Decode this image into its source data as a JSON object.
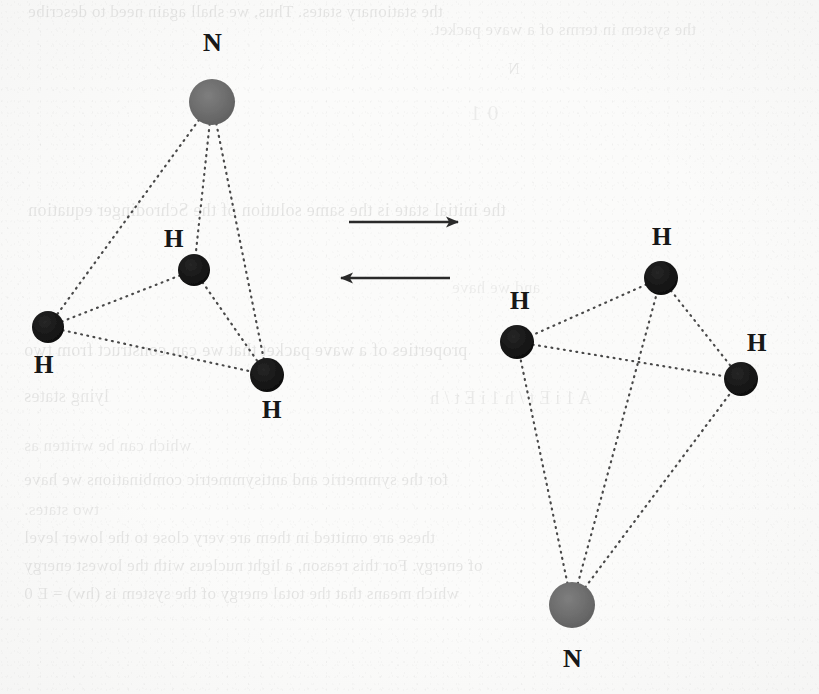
{
  "figure": {
    "kind": "molecular-diagram",
    "background_color": "#fbfbfa",
    "nitrogen_color": "#6b6b6b",
    "hydrogen_color": "#151515",
    "bond_color": "#4a4a4a",
    "arrow_color": "#2a2a2a"
  },
  "labels": {
    "nitrogen": "N",
    "hydrogen": "H"
  },
  "left_molecule": {
    "name": "ammonia-pyramid-apex-up",
    "atoms": [
      {
        "id": "N1",
        "element": "N",
        "label": "N",
        "cx": 212,
        "cy": 102,
        "r": 23,
        "kind": "nitrogen",
        "label_x": 203,
        "label_y": 30
      },
      {
        "id": "H1",
        "element": "H",
        "label": "H",
        "cx": 194,
        "cy": 270,
        "r": 16,
        "kind": "hydrogen",
        "label_x": 164,
        "label_y": 226
      },
      {
        "id": "H2",
        "element": "H",
        "label": "H",
        "cx": 48,
        "cy": 327,
        "r": 16,
        "kind": "hydrogen",
        "label_x": 34,
        "label_y": 352
      },
      {
        "id": "H3",
        "element": "H",
        "label": "H",
        "cx": 267,
        "cy": 375,
        "r": 17,
        "kind": "hydrogen",
        "label_x": 262,
        "label_y": 397
      }
    ],
    "bonds": [
      {
        "from": "N1",
        "to": "H1"
      },
      {
        "from": "N1",
        "to": "H2"
      },
      {
        "from": "N1",
        "to": "H3"
      },
      {
        "from": "H1",
        "to": "H2"
      },
      {
        "from": "H1",
        "to": "H3"
      },
      {
        "from": "H2",
        "to": "H3"
      }
    ]
  },
  "right_molecule": {
    "name": "ammonia-pyramid-apex-down",
    "atoms": [
      {
        "id": "N2",
        "element": "N",
        "label": "N",
        "cx": 572,
        "cy": 605,
        "r": 23,
        "kind": "nitrogen",
        "label_x": 563,
        "label_y": 646
      },
      {
        "id": "H4",
        "element": "H",
        "label": "H",
        "cx": 661,
        "cy": 278,
        "r": 17,
        "kind": "hydrogen",
        "label_x": 652,
        "label_y": 224
      },
      {
        "id": "H5",
        "element": "H",
        "label": "H",
        "cx": 517,
        "cy": 342,
        "r": 17,
        "kind": "hydrogen",
        "label_x": 510,
        "label_y": 288
      },
      {
        "id": "H6",
        "element": "H",
        "label": "H",
        "cx": 741,
        "cy": 379,
        "r": 17,
        "kind": "hydrogen",
        "label_x": 747,
        "label_y": 330
      }
    ],
    "bonds": [
      {
        "from": "N2",
        "to": "H4"
      },
      {
        "from": "N2",
        "to": "H5"
      },
      {
        "from": "N2",
        "to": "H6"
      },
      {
        "from": "H4",
        "to": "H5"
      },
      {
        "from": "H4",
        "to": "H6"
      },
      {
        "from": "H5",
        "to": "H6"
      }
    ]
  },
  "arrows": [
    {
      "name": "forward-arrow",
      "direction": "right",
      "x1": 349,
      "y1": 222,
      "x2": 458,
      "y2": 222
    },
    {
      "name": "reverse-arrow",
      "direction": "left",
      "x1": 450,
      "y1": 278,
      "x2": 341,
      "y2": 278
    }
  ],
  "ghost_text": {
    "note": "faint show-through text from the reverse side of the scanned page",
    "lines": [
      {
        "text": "the stationary states. Thus, we shall again need to describe",
        "x": 28,
        "y": 2,
        "size": 17,
        "opacity": 0.085
      },
      {
        "text": "the system in terms of a wave packet.",
        "x": 430,
        "y": 20,
        "size": 17,
        "opacity": 0.075
      },
      {
        "text": "N",
        "x": 508,
        "y": 60,
        "size": 16,
        "opacity": 0.08
      },
      {
        "text": "0   1",
        "x": 470,
        "y": 100,
        "size": 22,
        "opacity": 0.06
      },
      {
        "text": "the initial state is the same solution of the Schrodinger equation",
        "x": 28,
        "y": 200,
        "size": 18,
        "opacity": 0.085
      },
      {
        "text": "and we have",
        "x": 452,
        "y": 278,
        "size": 17,
        "opacity": 0.06
      },
      {
        "text": "properties of a wave packet that we can construct from two",
        "x": 24,
        "y": 340,
        "size": 18,
        "opacity": 0.085
      },
      {
        "text": "lying states",
        "x": 24,
        "y": 386,
        "size": 18,
        "opacity": 0.08
      },
      {
        "text": "A  1     i   E t / h     1     i   E t / h",
        "x": 430,
        "y": 388,
        "size": 18,
        "opacity": 0.065
      },
      {
        "text": "which can be written as",
        "x": 24,
        "y": 436,
        "size": 17,
        "opacity": 0.075
      },
      {
        "text": "for the symmetric and antisymmetric combinations we have",
        "x": 24,
        "y": 470,
        "size": 17,
        "opacity": 0.085
      },
      {
        "text": "two states.",
        "x": 24,
        "y": 500,
        "size": 17,
        "opacity": 0.07
      },
      {
        "text": "these are omitted in them are very close to the lower level",
        "x": 24,
        "y": 528,
        "size": 17,
        "opacity": 0.085
      },
      {
        "text": "of energy. For this reason, a light nucleus with the lowest energy",
        "x": 24,
        "y": 556,
        "size": 17,
        "opacity": 0.085
      },
      {
        "text": "which means that the total energy of the system is (hw) = E 0",
        "x": 24,
        "y": 584,
        "size": 17,
        "opacity": 0.085
      }
    ]
  }
}
